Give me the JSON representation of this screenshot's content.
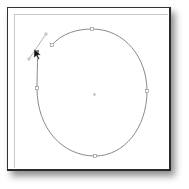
{
  "canvas": {
    "background": "#ffffff",
    "frame_color": "#2a2a2a",
    "inner_border_color": "#c8c8c8"
  },
  "path": {
    "stroke": "#8a8a8a",
    "type": "open-bezier-loop",
    "anchors": [
      {
        "x": 52,
        "y": 45
      },
      {
        "x": 92,
        "y": 29
      },
      {
        "x": 147,
        "y": 91
      },
      {
        "x": 95,
        "y": 156
      },
      {
        "x": 37,
        "y": 88
      },
      {
        "x": 37,
        "y": 52
      }
    ]
  },
  "handle": {
    "stroke": "#9a9a9a",
    "start": {
      "x": 29,
      "y": 59
    },
    "end": {
      "x": 46,
      "y": 34
    }
  },
  "center_point": {
    "x": 95,
    "y": 95
  },
  "cursor": {
    "icon": "arrow-pointer-icon",
    "x": 34,
    "y": 50
  }
}
